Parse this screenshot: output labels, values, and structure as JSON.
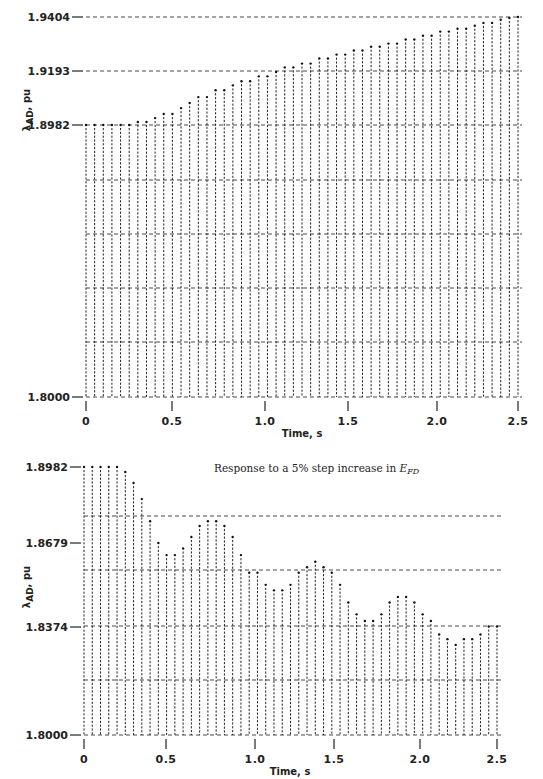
{
  "chart_data": [
    {
      "type": "bar",
      "style": "printer-plot dotted columns",
      "title": "",
      "xlabel": "Time, s",
      "ylabel": "λAD, pu",
      "xticks": [
        "0",
        "0.5",
        "1.0",
        "1.5",
        "2.0",
        "2.5"
      ],
      "yticks": [
        "1.9404",
        "1.9193",
        "1.8982",
        "1.8000"
      ],
      "xlim": [
        0,
        2.5
      ],
      "ylim": [
        1.8,
        1.9404
      ],
      "grid": true,
      "x": [
        0.0,
        0.05,
        0.1,
        0.15,
        0.2,
        0.25,
        0.3,
        0.35,
        0.4,
        0.45,
        0.5,
        0.55,
        0.6,
        0.65,
        0.7,
        0.75,
        0.8,
        0.85,
        0.9,
        0.95,
        1.0,
        1.05,
        1.1,
        1.15,
        1.2,
        1.25,
        1.3,
        1.35,
        1.4,
        1.45,
        1.5,
        1.55,
        1.6,
        1.65,
        1.7,
        1.75,
        1.8,
        1.85,
        1.9,
        1.95,
        2.0,
        2.05,
        2.1,
        2.15,
        2.2,
        2.25,
        2.3,
        2.35,
        2.4,
        2.45,
        2.5
      ],
      "values": [
        1.8982,
        1.8982,
        1.8982,
        1.8982,
        1.8982,
        1.8982,
        1.8994,
        1.8994,
        1.9009,
        1.9025,
        1.9025,
        1.9048,
        1.9068,
        1.9091,
        1.9091,
        1.9118,
        1.9118,
        1.9137,
        1.9153,
        1.9153,
        1.9172,
        1.9172,
        1.9189,
        1.9207,
        1.9207,
        1.9222,
        1.9222,
        1.9242,
        1.9242,
        1.9257,
        1.9257,
        1.9273,
        1.9273,
        1.9288,
        1.9288,
        1.93,
        1.93,
        1.9316,
        1.9316,
        1.9331,
        1.9331,
        1.9347,
        1.9347,
        1.9358,
        1.9358,
        1.937,
        1.9381,
        1.9381,
        1.9393,
        1.94,
        1.9404
      ]
    },
    {
      "type": "bar",
      "style": "printer-plot dotted columns",
      "title": "",
      "annotation": "Response to a 5% step increase in E_FD",
      "xlabel": "Time, s",
      "ylabel": "λAD, pu",
      "xticks": [
        "0",
        "0.5",
        "1.0",
        "1.5",
        "2.0",
        "2.5"
      ],
      "yticks": [
        "1.8982",
        "1.8679",
        "1.8374",
        "1.8000"
      ],
      "xlim": [
        0,
        2.5
      ],
      "ylim": [
        1.8,
        1.8982
      ],
      "grid": true,
      "x": [
        0.0,
        0.05,
        0.1,
        0.15,
        0.2,
        0.25,
        0.3,
        0.35,
        0.4,
        0.45,
        0.5,
        0.55,
        0.6,
        0.65,
        0.7,
        0.75,
        0.8,
        0.85,
        0.9,
        0.95,
        1.0,
        1.05,
        1.1,
        1.15,
        1.2,
        1.25,
        1.3,
        1.35,
        1.4,
        1.45,
        1.5,
        1.55,
        1.6,
        1.65,
        1.7,
        1.75,
        1.8,
        1.85,
        1.9,
        1.95,
        2.0,
        2.05,
        2.1,
        2.15,
        2.2,
        2.25,
        2.3,
        2.35,
        2.4,
        2.45,
        2.5
      ],
      "values": [
        1.8982,
        1.8982,
        1.8982,
        1.8982,
        1.8982,
        1.8962,
        1.8918,
        1.8854,
        1.8766,
        1.8679,
        1.8635,
        1.8635,
        1.8659,
        1.8703,
        1.8747,
        1.8766,
        1.8766,
        1.8747,
        1.8703,
        1.8635,
        1.8571,
        1.8571,
        1.8527,
        1.8507,
        1.8507,
        1.8527,
        1.8571,
        1.8591,
        1.8611,
        1.8591,
        1.8571,
        1.8527,
        1.8463,
        1.842,
        1.8396,
        1.8396,
        1.842,
        1.8463,
        1.8483,
        1.8483,
        1.8463,
        1.842,
        1.8396,
        1.8348,
        1.8332,
        1.8312,
        1.8332,
        1.8332,
        1.8348,
        1.8376,
        1.8376
      ]
    }
  ],
  "top_chart": {
    "ylabel_main": "λ",
    "ylabel_sub": "AD",
    "ylabel_unit": ", pu",
    "yticks": [
      {
        "label": "1.9404",
        "y": 17
      },
      {
        "label": "1.9193",
        "y": 71
      },
      {
        "label": "1.8982",
        "y": 125
      },
      {
        "label": "1.8000",
        "y": 397
      }
    ],
    "xticks": [
      {
        "label": "0",
        "x": 86
      },
      {
        "label": "0.5",
        "x": 172
      },
      {
        "label": "1.0",
        "x": 265
      },
      {
        "label": "1.5",
        "x": 348
      },
      {
        "label": "2.0",
        "x": 437
      },
      {
        "label": "2.5",
        "x": 518
      }
    ],
    "xlabel": "Time, s"
  },
  "bottom_chart": {
    "annotation_prefix": "Response to a 5% step increase in ",
    "annotation_var": "E",
    "annotation_sub": "FD",
    "ylabel_main": "λ",
    "ylabel_sub": "AD",
    "ylabel_unit": ", pu",
    "yticks": [
      {
        "label": "1.8982",
        "y": 467
      },
      {
        "label": "1.8679",
        "y": 543
      },
      {
        "label": "1.8374",
        "y": 627
      },
      {
        "label": "1.8000",
        "y": 735
      }
    ],
    "xticks": [
      {
        "label": "0",
        "x": 84
      },
      {
        "label": "0.5",
        "x": 166
      },
      {
        "label": "1.0",
        "x": 255
      },
      {
        "label": "1.5",
        "x": 334
      },
      {
        "label": "2.0",
        "x": 420
      },
      {
        "label": "2.5",
        "x": 497
      }
    ],
    "xlabel": "Time, s"
  }
}
